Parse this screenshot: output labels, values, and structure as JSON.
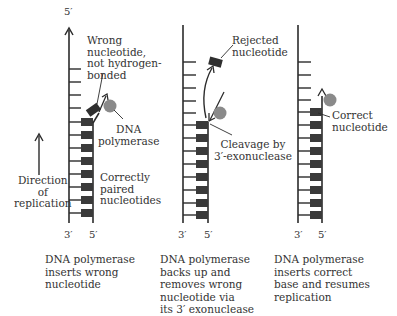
{
  "diagram": {
    "type": "DNA polymerase proofreading",
    "panels": [
      {
        "id": "insert-wrong",
        "top_label": "5′",
        "bottom_labels": [
          "3′",
          "5′"
        ],
        "labels": {
          "wrong_nucleotide": [
            "Wrong",
            "nucleotide,",
            "not hydrogen-",
            "bonded"
          ],
          "polymerase": [
            "DNA",
            "polymerase"
          ],
          "paired": [
            "Correctly",
            "paired",
            "nucleotides"
          ]
        },
        "caption": [
          "DNA polymerase",
          "inserts wrong",
          "nucleotide"
        ]
      },
      {
        "id": "excise",
        "labels": {
          "rejected": [
            "Rejected",
            "nucleotide"
          ],
          "cleavage": [
            "Cleavage by",
            "3′-exonuclease"
          ]
        },
        "bottom_labels": [
          "3′",
          "5′"
        ],
        "caption": [
          "DNA polymerase",
          "backs up and",
          "removes wrong",
          "nucleotide via",
          "its 3′ exonuclease"
        ]
      },
      {
        "id": "insert-correct",
        "labels": {
          "correct": [
            "Correct",
            "nucleotide"
          ]
        },
        "bottom_labels": [
          "3′",
          "5′"
        ],
        "caption": [
          "DNA polymerase",
          "inserts correct",
          "base and resumes",
          "replication"
        ]
      }
    ],
    "direction_label": [
      "Direction",
      "of",
      "replication"
    ],
    "colors": {
      "strand": "#2b2b2b",
      "block": "#3a3a3a",
      "polymerase": "#8a8a8a"
    }
  }
}
